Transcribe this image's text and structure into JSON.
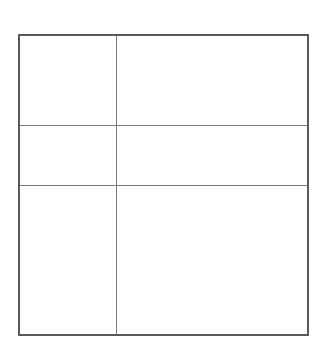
{
  "diagram": {
    "type": "grid",
    "rows": 3,
    "columns": 2,
    "border_color": "#5a5a5a",
    "line_color": "#7a7a7a",
    "background": "#ffffff",
    "cells": [
      {
        "row": 0,
        "col": 0,
        "label": ""
      },
      {
        "row": 0,
        "col": 1,
        "label": ""
      },
      {
        "row": 1,
        "col": 0,
        "label": ""
      },
      {
        "row": 1,
        "col": 1,
        "label": ""
      },
      {
        "row": 2,
        "col": 0,
        "label": ""
      },
      {
        "row": 2,
        "col": 1,
        "label": ""
      }
    ]
  }
}
